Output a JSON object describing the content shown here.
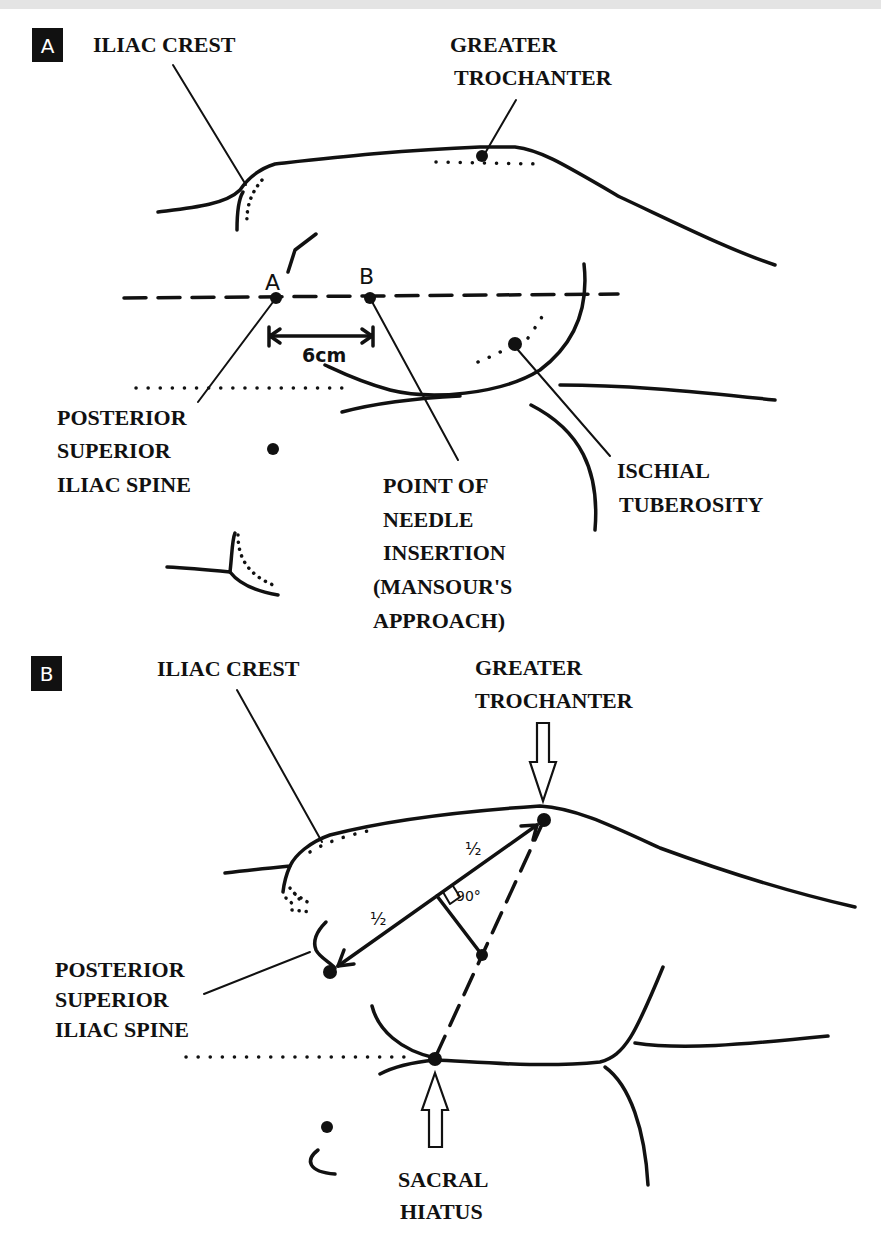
{
  "panel_a": {
    "panel_label": "A",
    "labels": {
      "iliac_crest": "ILIAC CREST",
      "greater_trochanter_line1": "GREATER",
      "greater_trochanter_line2": "TROCHANTER",
      "psis_line1": "POSTERIOR",
      "psis_line2": "SUPERIOR",
      "psis_line3": "ILIAC SPINE",
      "needle_line1": "POINT OF",
      "needle_line2": "NEEDLE",
      "needle_line3": "INSERTION",
      "needle_line4": "(MANSOUR'S",
      "needle_line5": "APPROACH)",
      "ischial_line1": "ISCHIAL",
      "ischial_line2": "TUBEROSITY"
    },
    "points": {
      "a": "A",
      "b": "B"
    },
    "measurement": "6cm"
  },
  "panel_b": {
    "panel_label": "B",
    "labels": {
      "iliac_crest": "ILIAC CREST",
      "greater_trochanter_line1": "GREATER",
      "greater_trochanter_line2": "TROCHANTER",
      "psis_line1": "POSTERIOR",
      "psis_line2": "SUPERIOR",
      "psis_line3": "ILIAC SPINE",
      "sacral_line1": "SACRAL",
      "sacral_line2": "HIATUS"
    },
    "half_upper": "½",
    "half_lower": "½",
    "angle": "90°"
  },
  "colors": {
    "ink": "#111111",
    "background": "#ffffff",
    "top_strip": "#e4e4e4"
  }
}
